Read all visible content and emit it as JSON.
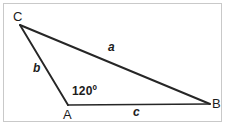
{
  "figure": {
    "kind": "geometry-triangle-diagram",
    "background_color": "#ffffff",
    "frame_border_color": "#c9c9c9",
    "stroke_color": "#262626",
    "text_color": "#1c1c1c",
    "vertices": [
      {
        "key": "C",
        "label": "C",
        "x": 20,
        "y": 25
      },
      {
        "key": "A",
        "label": "A",
        "x": 68,
        "y": 105
      },
      {
        "key": "B",
        "label": "B",
        "x": 210,
        "y": 104
      }
    ],
    "sides": [
      {
        "key": "a",
        "label": "a",
        "from": "C",
        "to": "B",
        "opposite_vertex": "A"
      },
      {
        "key": "b",
        "label": "b",
        "from": "C",
        "to": "A",
        "opposite_vertex": "B"
      },
      {
        "key": "c",
        "label": "c",
        "from": "A",
        "to": "B",
        "opposite_vertex": "C"
      }
    ],
    "angles": [
      {
        "at_vertex": "A",
        "label": "120º",
        "value": 120,
        "unit": "degrees"
      }
    ]
  }
}
